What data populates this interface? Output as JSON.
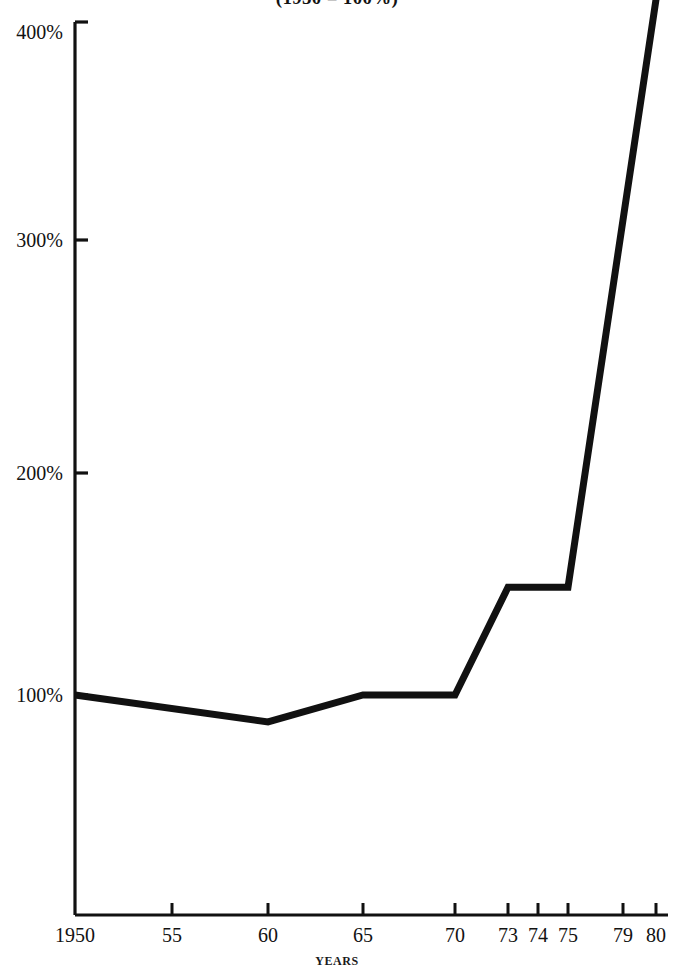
{
  "chart_data": {
    "type": "line",
    "title": "(1950 = 100%)",
    "xlabel": "YEARS",
    "ylabel": "",
    "x": [
      1950,
      1960,
      1965,
      1970,
      1973,
      1975,
      1980
    ],
    "values": [
      100,
      88,
      100,
      100,
      148,
      148,
      410
    ],
    "xtick_values": [
      1950,
      1955,
      1960,
      1965,
      1970,
      1973,
      1974,
      1975,
      1979,
      1980
    ],
    "xtick_labels": [
      "1950",
      "55",
      "60",
      "65",
      "70",
      "73",
      "74",
      "75",
      "79",
      "80"
    ],
    "ytick_values": [
      100,
      200,
      300,
      400
    ],
    "ytick_labels": [
      "100%",
      "200%",
      "300%",
      "400%"
    ],
    "xlim": [
      1950,
      1980
    ],
    "ylim": [
      0,
      400
    ],
    "grid": false,
    "legend": null,
    "series": [
      {
        "name": "index",
        "points": [
          {
            "x": 1950,
            "y": 100
          },
          {
            "x": 1960,
            "y": 88
          },
          {
            "x": 1965,
            "y": 100
          },
          {
            "x": 1970,
            "y": 100
          },
          {
            "x": 1973,
            "y": 148
          },
          {
            "x": 1975,
            "y": 148
          },
          {
            "x": 1980,
            "y": 410
          }
        ]
      }
    ],
    "line_color": "#111111",
    "background_color": "#ffffff",
    "note": "Line is clipped at the top edge of the image above 400%."
  },
  "figure": {
    "title": "(1950 = 100%)",
    "axis_title_x": "YEARS",
    "y_labels": [
      "400%",
      "300%",
      "200%",
      "100%"
    ],
    "x_labels": [
      "1950",
      "55",
      "60",
      "65",
      "70",
      "73",
      "74",
      "75",
      "79",
      "80"
    ]
  }
}
